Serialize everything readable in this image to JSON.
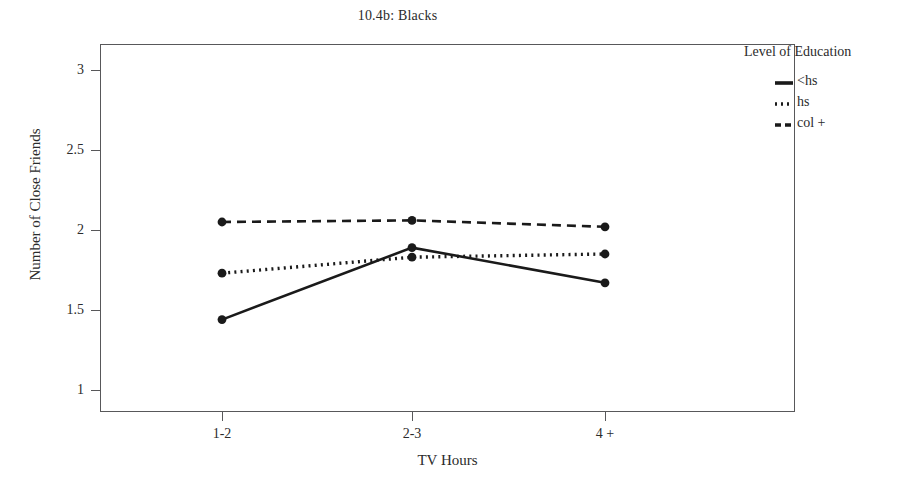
{
  "chart_data": {
    "type": "line",
    "title": "10.4b: Blacks",
    "xlabel": "TV Hours",
    "ylabel": "Number of Close Friends",
    "categories": [
      "1-2",
      "2-3",
      "4 +"
    ],
    "ylim": [
      1,
      3
    ],
    "yticks": [
      "1",
      "1.5",
      "2",
      "2.5",
      "3"
    ],
    "ytick_values": [
      1,
      1.5,
      2,
      2.5,
      3
    ],
    "grid": false,
    "legend_position": "right",
    "legend_title": "Level of Education",
    "series": [
      {
        "name": "<hs",
        "values": [
          1.44,
          1.89,
          1.67
        ],
        "style": "solid",
        "color": "#1a1a1a",
        "marker": "circle"
      },
      {
        "name": "hs",
        "values": [
          1.73,
          1.83,
          1.85
        ],
        "style": "dotted",
        "color": "#1a1a1a",
        "marker": "circle"
      },
      {
        "name": "col +",
        "values": [
          2.05,
          2.06,
          2.02
        ],
        "style": "dashed",
        "color": "#1a1a1a",
        "marker": "circle"
      }
    ]
  },
  "axes": {
    "y_label": "Number of Close Friends",
    "x_label": "TV Hours",
    "y_tick_labels": [
      "3",
      "2.5",
      "2",
      "1.5",
      "1"
    ],
    "x_tick_labels": [
      "1-2",
      "2-3",
      "4 +"
    ]
  },
  "legend": {
    "title": "Level of Education",
    "items": [
      {
        "label": "<hs"
      },
      {
        "label": "hs"
      },
      {
        "label": "col +"
      }
    ]
  },
  "colors": {
    "ink": "#1a1a1a",
    "axis": "#58585a",
    "background": "#ffffff"
  }
}
